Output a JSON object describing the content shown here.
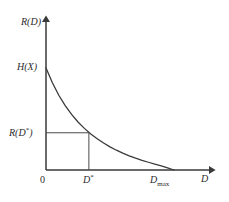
{
  "figure": {
    "kind": "rate-distortion-curve",
    "stroke_color": "#3a3a3a",
    "background_color": "#ffffff"
  },
  "labels": {
    "y_axis": "R(D)",
    "x_axis": "D",
    "y_intercept": "H(X)",
    "rate_at_dstar_main": "R(D",
    "rate_at_dstar_sup": "*",
    "rate_at_dstar_close": ")",
    "origin": "0",
    "dstar_main": "D",
    "dstar_sup": "*",
    "dmax_main": "D",
    "dmax_sub": "max"
  },
  "chart_data": {
    "type": "line",
    "title": "",
    "xlabel": "D",
    "ylabel": "R(D)",
    "xlim": [
      0,
      1.35
    ],
    "ylim": [
      0,
      1.25
    ],
    "grid": false,
    "legend": null,
    "series": [
      {
        "name": "R(D)",
        "comment": "convex decreasing rate-distortion function from H(X) at D=0 to 0 at D_max",
        "x": [
          0.0,
          0.05,
          0.1,
          0.15,
          0.2,
          0.25,
          0.3,
          0.35,
          0.4,
          0.45,
          0.5,
          0.55,
          0.6,
          0.65,
          0.7,
          0.75,
          0.8,
          0.85,
          0.9,
          0.95,
          1.0
        ],
        "y": [
          1.0,
          0.855,
          0.733,
          0.631,
          0.545,
          0.471,
          0.408,
          0.353,
          0.306,
          0.264,
          0.227,
          0.194,
          0.165,
          0.139,
          0.116,
          0.095,
          0.076,
          0.058,
          0.041,
          0.021,
          0.0
        ]
      }
    ],
    "annotations": [
      {
        "label": "H(X)",
        "axis": "y",
        "value": 1.0,
        "note": "curve value at D = 0"
      },
      {
        "label": "R(D*)",
        "axis": "y",
        "value": 0.365,
        "note": "rate at the chosen distortion D*"
      },
      {
        "label": "0",
        "axis": "x",
        "value": 0.0,
        "note": "origin"
      },
      {
        "label": "D*",
        "axis": "x",
        "value": 0.335,
        "note": "chosen distortion, construction lines drawn"
      },
      {
        "label": "D_max",
        "axis": "x",
        "value": 1.0,
        "note": "distortion at which rate reaches zero"
      }
    ],
    "construction_lines": [
      {
        "from": "y-axis at R(D*)",
        "to": "curve at D*",
        "orientation": "horizontal"
      },
      {
        "from": "curve at D*",
        "to": "x-axis at D*",
        "orientation": "vertical"
      }
    ]
  }
}
